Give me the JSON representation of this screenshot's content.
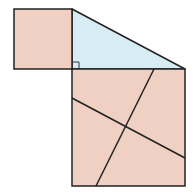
{
  "diagram": {
    "colors": {
      "square_fill": "#EFD0C2",
      "triangle_fill": "#D8ECF5",
      "stroke": "#222222",
      "background": "#FFFFFF"
    },
    "small_square": {
      "x": 14,
      "y": 9,
      "w": 58,
      "h": 60
    },
    "triangle": {
      "points": [
        [
          72,
          9
        ],
        [
          185,
          69
        ],
        [
          72,
          69
        ]
      ]
    },
    "right_angle_marker": {
      "x": 72,
      "y": 62,
      "size": 7
    },
    "large_square": {
      "x": 72,
      "y": 69,
      "w": 113,
      "h": 117
    },
    "cut_lines": [
      {
        "name": "cut-line-1",
        "x1": 72,
        "y1": 98,
        "x2": 185,
        "y2": 158
      },
      {
        "name": "cut-line-2",
        "x1": 154,
        "y1": 69,
        "x2": 96,
        "y2": 186
      }
    ]
  }
}
